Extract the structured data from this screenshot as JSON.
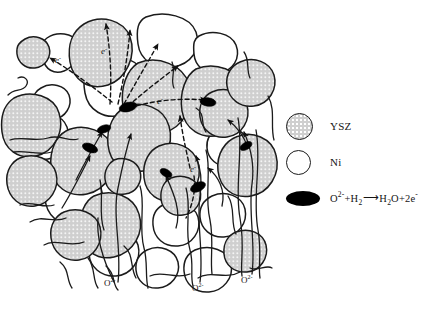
{
  "colors": {
    "ysz_fill": "#cfcfcf",
    "ni_fill": "#ffffff",
    "tpb_fill": "#000000",
    "outline": "#1b1b1b",
    "background": "#ffffff"
  },
  "legend": {
    "items": [
      {
        "icon": "ysz-particle-circle-icon",
        "label": "YSZ",
        "swatch": "gray-speckled-circle"
      },
      {
        "icon": "ni-particle-circle-icon",
        "label": "Ni",
        "swatch": "white-circle"
      },
      {
        "icon": "tpb-reaction-site-ellipse-icon",
        "label": "O²⁻+H₂ ⟶ H₂O+2e⁻",
        "swatch": "black-ellipse",
        "equation": {
          "reactant_ion": "O",
          "reactant_ion_charge": "2-",
          "plus": "+",
          "reactant_gas": "H",
          "reactant_gas_sub": "2",
          "arrow": "⟶",
          "product_water": "H",
          "product_water_sub": "2",
          "product_water_o": "O",
          "product_plus": "+2",
          "product_electron": "e",
          "product_electron_charge": "-"
        }
      }
    ]
  },
  "diagram_labels": {
    "electron_label": "e",
    "electron_superscript": "-",
    "ion_label": "O",
    "ion_superscript": "2-",
    "electron_markers": [
      {
        "id": "e-top-left",
        "x": 55,
        "y": 63
      },
      {
        "id": "e-upper-mid",
        "x": 101,
        "y": 54
      },
      {
        "id": "e-mid-right",
        "x": 157,
        "y": 104
      },
      {
        "id": "e-lower-mid",
        "x": 190,
        "y": 172
      }
    ],
    "ion_markers": [
      {
        "id": "o-bottom-left",
        "x": 108,
        "y": 284
      },
      {
        "id": "o-bottom-center",
        "x": 196,
        "y": 289
      },
      {
        "id": "o-bottom-right",
        "x": 245,
        "y": 281
      }
    ]
  }
}
